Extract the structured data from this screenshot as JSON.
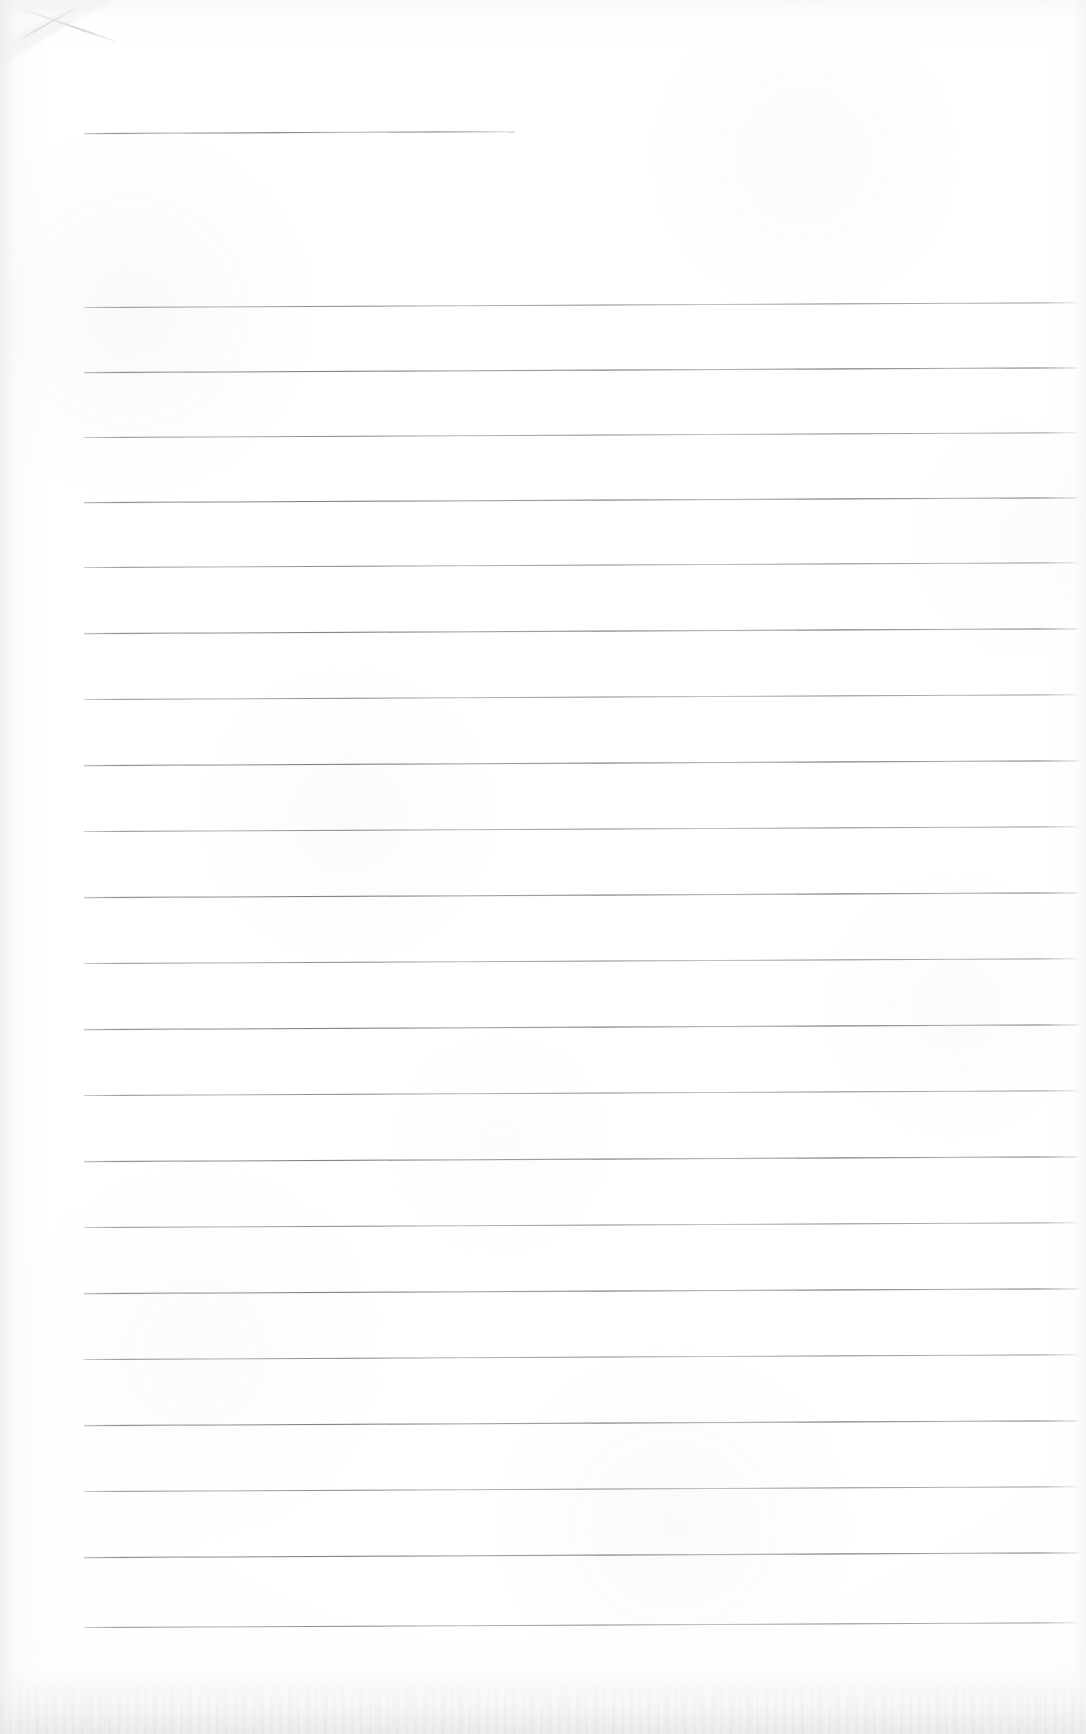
{
  "document": {
    "kind": "scanned-lined-paper",
    "title": "Blank ruled notepad page",
    "page_width": 1086,
    "page_height": 1734,
    "background_color": "#ffffff",
    "rule_color": "#6c6c78",
    "paper_shadow_color": "#ececee",
    "visible_text": "",
    "note": "No printed or handwritten text is present on this page."
  },
  "artifacts": {
    "corner_fold": {
      "name": "top-left-folded-corner",
      "x": 0,
      "y": 0,
      "width": 132,
      "height": 88
    },
    "bottom_edge": {
      "name": "bottom-scan-edge-speckle",
      "height": 96
    }
  },
  "ruling": {
    "left_margin_x": 84,
    "right_margin_x": 1078,
    "line_spacing": 66,
    "line_thickness": 1,
    "tilt_degrees": -0.28,
    "header_rule": {
      "label": "header-rule",
      "y": 133,
      "x_start": 84,
      "x_end": 515
    },
    "body_rules": [
      {
        "label": "rule-1",
        "y": 307,
        "x_start": 84,
        "x_end": 1078
      },
      {
        "label": "rule-2",
        "y": 372,
        "x_start": 84,
        "x_end": 1078
      },
      {
        "label": "rule-3",
        "y": 437,
        "x_start": 84,
        "x_end": 1078
      },
      {
        "label": "rule-4",
        "y": 502,
        "x_start": 84,
        "x_end": 1078
      },
      {
        "label": "rule-5",
        "y": 567,
        "x_start": 84,
        "x_end": 1078
      },
      {
        "label": "rule-6",
        "y": 633,
        "x_start": 84,
        "x_end": 1078
      },
      {
        "label": "rule-7",
        "y": 699,
        "x_start": 84,
        "x_end": 1078
      },
      {
        "label": "rule-8",
        "y": 765,
        "x_start": 84,
        "x_end": 1078
      },
      {
        "label": "rule-9",
        "y": 831,
        "x_start": 84,
        "x_end": 1078
      },
      {
        "label": "rule-10",
        "y": 897,
        "x_start": 84,
        "x_end": 1078
      },
      {
        "label": "rule-11",
        "y": 963,
        "x_start": 84,
        "x_end": 1078
      },
      {
        "label": "rule-12",
        "y": 1029,
        "x_start": 84,
        "x_end": 1078
      },
      {
        "label": "rule-13",
        "y": 1095,
        "x_start": 84,
        "x_end": 1078
      },
      {
        "label": "rule-14",
        "y": 1161,
        "x_start": 84,
        "x_end": 1078
      },
      {
        "label": "rule-15",
        "y": 1227,
        "x_start": 84,
        "x_end": 1078
      },
      {
        "label": "rule-16",
        "y": 1293,
        "x_start": 84,
        "x_end": 1078
      },
      {
        "label": "rule-17",
        "y": 1359,
        "x_start": 84,
        "x_end": 1078
      },
      {
        "label": "rule-18",
        "y": 1425,
        "x_start": 84,
        "x_end": 1078
      },
      {
        "label": "rule-19",
        "y": 1491,
        "x_start": 84,
        "x_end": 1078
      },
      {
        "label": "rule-20",
        "y": 1557,
        "x_start": 84,
        "x_end": 1078
      },
      {
        "label": "rule-21",
        "y": 1627,
        "x_start": 84,
        "x_end": 1078
      }
    ]
  }
}
